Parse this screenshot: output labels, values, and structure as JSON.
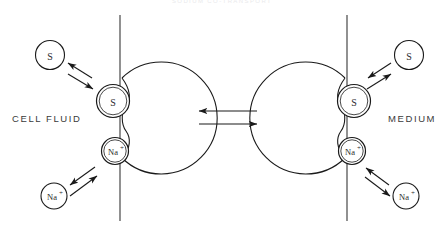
{
  "figure": {
    "title": "SODIUM CO-TRANSPORT",
    "left_compartment_label": "CELL FLUID",
    "right_compartment_label": "MEDIUM"
  },
  "species": {
    "substrate": "S",
    "sodium": "Na",
    "sodium_charge": "+"
  },
  "left_side": {
    "free_substrate": "S",
    "bound_substrate": "S",
    "bound_sodium": "Na",
    "bound_sodium_charge": "+",
    "free_sodium": "Na",
    "free_sodium_charge": "+"
  },
  "right_side": {
    "free_substrate": "S",
    "bound_substrate": "S",
    "bound_sodium": "Na",
    "bound_sodium_charge": "+",
    "free_sodium": "Na",
    "free_sodium_charge": "+"
  },
  "colors": {
    "stroke": "#1a1a1a",
    "membrane": "#555555",
    "text": "#3a3a3a",
    "background": "#ffffff"
  }
}
